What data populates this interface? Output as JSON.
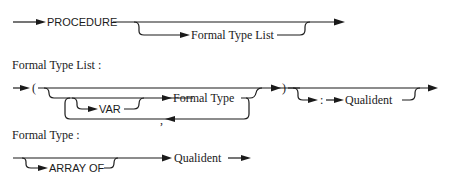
{
  "diagrams": {
    "procedure": {
      "keyword": "PROCEDURE",
      "optional": "Formal Type List"
    },
    "formal_type_list": {
      "heading": "Formal Type List :",
      "open_paren": "(",
      "var_keyword": "VAR",
      "formal_type": "Formal Type",
      "separator": ",",
      "close_paren": ")",
      "colon": ":",
      "qualident": "Qualident"
    },
    "formal_type": {
      "heading": "Formal Type :",
      "array_of": "ARRAY OF",
      "qualident": "Qualident"
    }
  },
  "colors": {
    "ink": "#1a1a1a",
    "background": "#ffffff"
  }
}
